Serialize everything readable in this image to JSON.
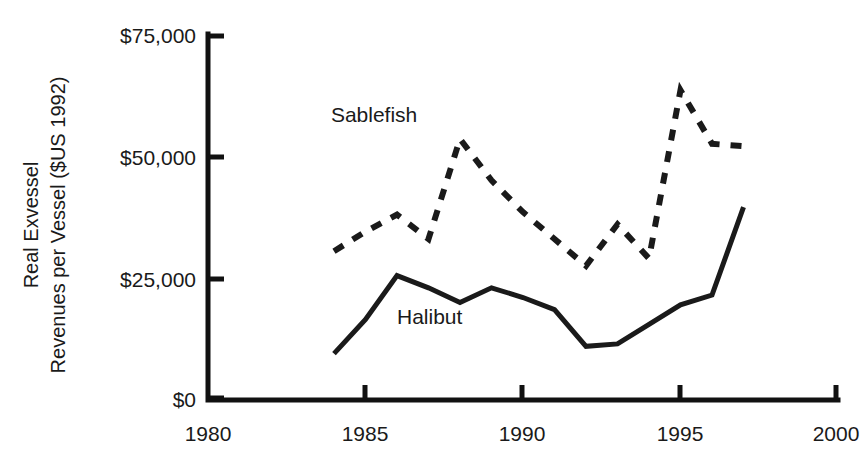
{
  "chart_data": {
    "type": "line",
    "title": "",
    "subtitle": "",
    "xlabel": "",
    "ylabel": "Real Exvessel Revenues per Vessel ($US 1992)",
    "ylabel_lines": [
      "Real Exvessel",
      "Revenues per Vessel ($US 1992)"
    ],
    "xlim": [
      1980,
      2000
    ],
    "ylim": [
      0,
      75000
    ],
    "grid": false,
    "legend_position": "inline-annotation",
    "x_ticks": [
      1980,
      1985,
      1990,
      1995,
      2000
    ],
    "x_tick_labels": [
      "1980",
      "1985",
      "1990",
      "1995",
      "2000"
    ],
    "y_ticks": [
      0,
      25000,
      50000,
      75000
    ],
    "y_tick_labels": [
      "$0",
      "$25,000",
      "$50,000",
      "$75,000"
    ],
    "series": [
      {
        "name": "Sablefish",
        "style": "dashed",
        "color": "#1a1a1a",
        "x": [
          1984,
          1985,
          1986,
          1987,
          1988,
          1989,
          1990,
          1991,
          1992,
          1993,
          1994,
          1995,
          1996,
          1997
        ],
        "values": [
          30500,
          34500,
          38000,
          33000,
          53500,
          45000,
          38500,
          33000,
          27500,
          36000,
          29000,
          63500,
          52500,
          52000
        ]
      },
      {
        "name": "Halibut",
        "style": "solid",
        "color": "#1a1a1a",
        "x": [
          1984,
          1985,
          1986,
          1987,
          1988,
          1989,
          1990,
          1991,
          1992,
          1993,
          1994,
          1995,
          1996,
          1997
        ],
        "values": [
          9500,
          16500,
          25500,
          23000,
          20000,
          23000,
          21000,
          18500,
          11000,
          11500,
          15500,
          19500,
          21500,
          39500
        ]
      }
    ],
    "annotations": [
      {
        "text": "Sablefish",
        "x": 1983.9,
        "y": 57000
      },
      {
        "text": "Halibut",
        "x": 1986.0,
        "y": 15500
      }
    ]
  }
}
